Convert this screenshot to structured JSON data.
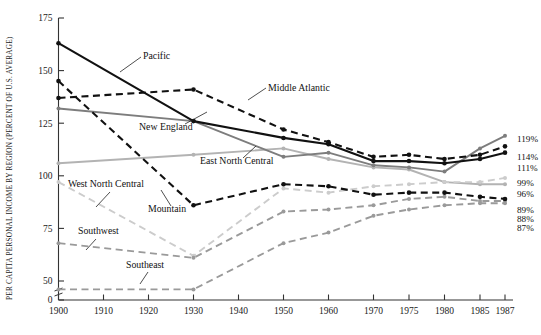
{
  "chart_data": {
    "type": "line",
    "title": "",
    "xlabel": "",
    "ylabel": "PER CAPITA PERSONAL INCOME BY REGION (PERCENT OF U.S. AVERAGE)",
    "x": [
      1900,
      1910,
      1920,
      1930,
      1940,
      1950,
      1960,
      1970,
      1975,
      1980,
      1985,
      1987
    ],
    "xtick_labels": [
      "1900",
      "1910",
      "1920",
      "1930",
      "1940",
      "1950",
      "1960",
      "1970",
      "1975",
      "1980",
      "1985",
      "1987"
    ],
    "ytick_labels": [
      "0",
      "50",
      "75",
      "100",
      "125",
      "150",
      "175"
    ],
    "ytick_values": [
      0,
      50,
      75,
      100,
      125,
      150,
      175
    ],
    "ylim": [
      50,
      175
    ],
    "axis_break": true,
    "grid": false,
    "legend_position": "inline-annotations",
    "series": [
      {
        "name": "Pacific",
        "label": "Pacific",
        "color": "#111111",
        "style": "solid",
        "end_label": "111%",
        "values": [
          163,
          null,
          null,
          126,
          null,
          118,
          115,
          107,
          107,
          106,
          108,
          111
        ]
      },
      {
        "name": "Middle Atlantic",
        "label": "Middle Atlantic",
        "color": "#111111",
        "style": "dashed",
        "end_label": "114%",
        "values": [
          137,
          null,
          null,
          141,
          null,
          122,
          116,
          109,
          110,
          108,
          110,
          114
        ]
      },
      {
        "name": "New England",
        "label": "New England",
        "color": "#7d7d7d",
        "style": "solid",
        "end_label": "119%",
        "values": [
          132,
          null,
          null,
          126,
          null,
          109,
          111,
          105,
          104,
          102,
          113,
          119
        ]
      },
      {
        "name": "East North Central",
        "label": "East North Central",
        "color": "#b3b3b3",
        "style": "solid",
        "end_label": "96%",
        "values": [
          106,
          null,
          null,
          110,
          null,
          113,
          108,
          104,
          103,
          97,
          96,
          96
        ]
      },
      {
        "name": "Mountain",
        "label": "Mountain",
        "color": "#111111",
        "style": "dashed",
        "end_label": "89%",
        "values": [
          145,
          null,
          null,
          86,
          null,
          96,
          95,
          91,
          92,
          92,
          90,
          89
        ]
      },
      {
        "name": "West North Central",
        "label": "West North Central",
        "color": "#cccccc",
        "style": "dashed",
        "end_label": "99%",
        "values": [
          97,
          null,
          null,
          62,
          null,
          94,
          92,
          95,
          96,
          97,
          97,
          99
        ]
      },
      {
        "name": "Southwest",
        "label": "Southwest",
        "color": "#9a9a9a",
        "style": "dashed",
        "end_label": "88%",
        "values": [
          68,
          null,
          null,
          61,
          null,
          83,
          84,
          86,
          89,
          90,
          88,
          88
        ]
      },
      {
        "name": "Southeast",
        "label": "Southeast",
        "color": "#9a9a9a",
        "style": "dashed",
        "end_label": "87%",
        "values": [
          46,
          null,
          null,
          46,
          null,
          68,
          73,
          81,
          84,
          86,
          87,
          87
        ]
      }
    ],
    "annotations": [
      {
        "text": "Pacific",
        "x": 143,
        "y": 59
      },
      {
        "text": "Middle Atlantic",
        "x": 268,
        "y": 91
      },
      {
        "text": "New England",
        "x": 139,
        "y": 130
      },
      {
        "text": "East North Central",
        "x": 200,
        "y": 164
      },
      {
        "text": "Mountain",
        "x": 148,
        "y": 212
      },
      {
        "text": "West North Central",
        "x": 68,
        "y": 187
      },
      {
        "text": "Southwest",
        "x": 78,
        "y": 234
      },
      {
        "text": "Southeast",
        "x": 126,
        "y": 268
      }
    ],
    "end_labels": [
      "119%",
      "114%",
      "111%",
      "99%",
      "96%",
      "89%",
      "88%",
      "87%"
    ]
  }
}
